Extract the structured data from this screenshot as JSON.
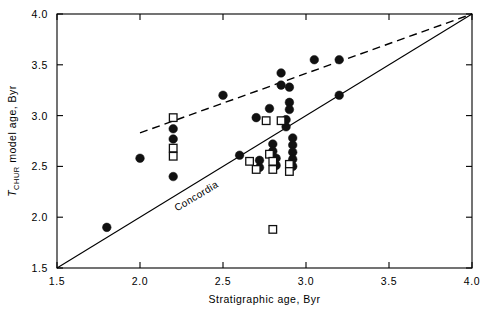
{
  "chart_data": {
    "type": "scatter",
    "title": "",
    "xlabel": "Stratigraphic age, Byr",
    "ylabel": "T_CHUR model age, Byr",
    "ylabel_parts": {
      "italic": "T",
      "subscript": "CHUR",
      "rest": " model age, Byr"
    },
    "xlim": [
      1.5,
      4.0
    ],
    "ylim": [
      1.5,
      4.0
    ],
    "xticks": [
      1.5,
      2.0,
      2.5,
      3.0,
      3.5,
      4.0
    ],
    "yticks": [
      1.5,
      2.0,
      2.5,
      3.0,
      3.5,
      4.0
    ],
    "xtick_labels": [
      "1.5",
      "2.0",
      "2.5",
      "3.0",
      "3.5",
      "4.0"
    ],
    "ytick_labels": [
      "1.5",
      "2.0",
      "2.5",
      "3.0",
      "3.5",
      "4.0"
    ],
    "grid": false,
    "legend": "none",
    "annotations": [
      {
        "text": "Concordia",
        "x": 2.35,
        "y": 2.18,
        "rotation": -31
      }
    ],
    "lines": [
      {
        "name": "concordia",
        "style": "solid",
        "x": [
          1.5,
          4.0
        ],
        "y": [
          1.5,
          4.0
        ]
      },
      {
        "name": "upper-envelope",
        "style": "dashed",
        "x": [
          2.0,
          4.0
        ],
        "y": [
          2.83,
          4.0
        ]
      }
    ],
    "series": [
      {
        "name": "filled-circles",
        "marker": "filled-circle",
        "points": [
          [
            1.8,
            1.9
          ],
          [
            2.0,
            2.58
          ],
          [
            2.2,
            2.87
          ],
          [
            2.2,
            2.77
          ],
          [
            2.2,
            2.4
          ],
          [
            2.5,
            3.2
          ],
          [
            2.6,
            2.61
          ],
          [
            2.7,
            2.98
          ],
          [
            2.72,
            2.56
          ],
          [
            2.72,
            2.49
          ],
          [
            2.78,
            3.07
          ],
          [
            2.8,
            2.72
          ],
          [
            2.8,
            2.65
          ],
          [
            2.82,
            2.58
          ],
          [
            2.82,
            2.51
          ],
          [
            2.85,
            3.42
          ],
          [
            2.85,
            3.3
          ],
          [
            2.88,
            2.96
          ],
          [
            2.88,
            2.89
          ],
          [
            2.9,
            3.28
          ],
          [
            2.9,
            3.13
          ],
          [
            2.9,
            3.06
          ],
          [
            2.92,
            2.78
          ],
          [
            2.92,
            2.71
          ],
          [
            2.92,
            2.64
          ],
          [
            2.92,
            2.57
          ],
          [
            2.92,
            2.5
          ],
          [
            3.05,
            3.55
          ],
          [
            3.2,
            3.55
          ],
          [
            3.2,
            3.2
          ]
        ]
      },
      {
        "name": "open-squares",
        "marker": "open-square",
        "points": [
          [
            2.2,
            2.98
          ],
          [
            2.2,
            2.68
          ],
          [
            2.2,
            2.6
          ],
          [
            2.66,
            2.55
          ],
          [
            2.7,
            2.47
          ],
          [
            2.76,
            2.95
          ],
          [
            2.78,
            2.62
          ],
          [
            2.8,
            2.55
          ],
          [
            2.8,
            2.47
          ],
          [
            2.8,
            1.88
          ],
          [
            2.85,
            2.95
          ],
          [
            2.9,
            2.52
          ],
          [
            2.9,
            2.45
          ]
        ]
      }
    ]
  },
  "colors": {
    "ink": "#000000",
    "marker_fill": "#111111",
    "background": "#ffffff"
  }
}
